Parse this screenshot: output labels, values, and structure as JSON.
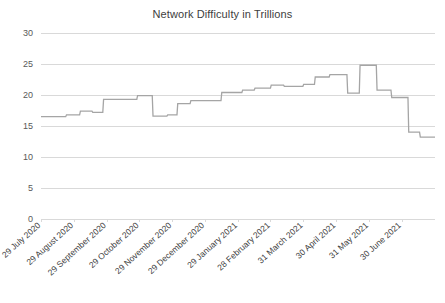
{
  "chart_data": {
    "type": "line",
    "title": "Network Difficulty in Trillions",
    "xlabel": "",
    "ylabel": "",
    "ylim": [
      0,
      30
    ],
    "y_ticks": [
      0,
      5,
      10,
      15,
      20,
      25,
      30
    ],
    "grid": true,
    "legend": "none",
    "line_color": "#a5a5a5",
    "grid_color": "#d9d9d9",
    "x_tick_labels": [
      "29 July 2020",
      "29 August 2020",
      "29 September 2020",
      "29 October 2020",
      "29 November 2020",
      "29 December 2020",
      "29 January 2021",
      "28 February 2021",
      "31 March 2021",
      "30 April 2021",
      "31 May 2021",
      "30 June 2021"
    ],
    "x_axis_span": [
      "29 July 2020",
      "30 June 2021"
    ],
    "series": [
      {
        "name": "Network Difficulty",
        "step_style": "stepped",
        "points": [
          {
            "x": 0.0,
            "y": 16.5
          },
          {
            "x": 3.2,
            "y": 16.5
          },
          {
            "x": 3.3,
            "y": 16.8
          },
          {
            "x": 5.0,
            "y": 16.8
          },
          {
            "x": 5.1,
            "y": 17.4
          },
          {
            "x": 6.6,
            "y": 17.4
          },
          {
            "x": 6.7,
            "y": 17.2
          },
          {
            "x": 8.0,
            "y": 17.2
          },
          {
            "x": 8.1,
            "y": 19.3
          },
          {
            "x": 12.4,
            "y": 19.3
          },
          {
            "x": 12.5,
            "y": 19.9
          },
          {
            "x": 14.4,
            "y": 19.9
          },
          {
            "x": 14.5,
            "y": 16.6
          },
          {
            "x": 16.3,
            "y": 16.6
          },
          {
            "x": 16.4,
            "y": 16.8
          },
          {
            "x": 17.6,
            "y": 16.8
          },
          {
            "x": 17.7,
            "y": 18.6
          },
          {
            "x": 19.3,
            "y": 18.6
          },
          {
            "x": 19.4,
            "y": 19.1
          },
          {
            "x": 23.3,
            "y": 19.1
          },
          {
            "x": 23.4,
            "y": 20.4
          },
          {
            "x": 26.0,
            "y": 20.4
          },
          {
            "x": 26.1,
            "y": 20.8
          },
          {
            "x": 27.6,
            "y": 20.8
          },
          {
            "x": 27.7,
            "y": 21.1
          },
          {
            "x": 29.7,
            "y": 21.1
          },
          {
            "x": 29.8,
            "y": 21.6
          },
          {
            "x": 31.4,
            "y": 21.6
          },
          {
            "x": 31.5,
            "y": 21.4
          },
          {
            "x": 33.9,
            "y": 21.4
          },
          {
            "x": 34.0,
            "y": 21.7
          },
          {
            "x": 35.4,
            "y": 21.7
          },
          {
            "x": 35.5,
            "y": 22.9
          },
          {
            "x": 37.3,
            "y": 22.9
          },
          {
            "x": 37.4,
            "y": 23.3
          },
          {
            "x": 39.6,
            "y": 23.3
          },
          {
            "x": 39.7,
            "y": 20.3
          },
          {
            "x": 41.2,
            "y": 20.3
          },
          {
            "x": 41.3,
            "y": 24.8
          },
          {
            "x": 43.4,
            "y": 24.8
          },
          {
            "x": 43.5,
            "y": 20.8
          },
          {
            "x": 45.3,
            "y": 20.8
          },
          {
            "x": 45.4,
            "y": 19.6
          },
          {
            "x": 47.5,
            "y": 19.6
          },
          {
            "x": 47.6,
            "y": 14.0
          },
          {
            "x": 49.0,
            "y": 14.0
          },
          {
            "x": 49.1,
            "y": 13.2
          },
          {
            "x": 51.0,
            "y": 13.2
          }
        ]
      }
    ]
  }
}
